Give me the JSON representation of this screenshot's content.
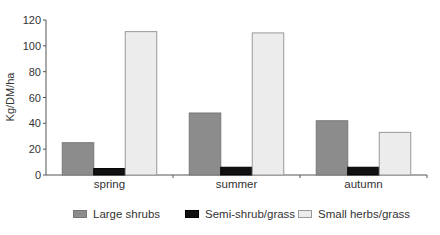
{
  "chart_data": {
    "type": "bar",
    "title": "",
    "xlabel": "",
    "ylabel": "Kg/DM/ha",
    "ylim": [
      0,
      120
    ],
    "yticks": [
      0,
      20,
      40,
      60,
      80,
      100,
      120
    ],
    "grid": false,
    "legend_position": "bottom",
    "categories": [
      "spring",
      "summer",
      "autumn"
    ],
    "series": [
      {
        "name": "Large shrubs",
        "color": "#8c8c8c",
        "values": [
          25,
          48,
          42
        ]
      },
      {
        "name": "Semi-shrub/grass",
        "color": "#111111",
        "values": [
          5,
          6,
          6
        ]
      },
      {
        "name": "Small herbs/grass",
        "color": "#ececec",
        "values": [
          111,
          110,
          33
        ]
      }
    ]
  },
  "legend": {
    "items": [
      {
        "label": "Large shrubs",
        "color": "#8c8c8c"
      },
      {
        "label": "Semi-shrub/grass",
        "color": "#111111"
      },
      {
        "label": "Small herbs/grass",
        "color": "#ececec"
      }
    ]
  }
}
